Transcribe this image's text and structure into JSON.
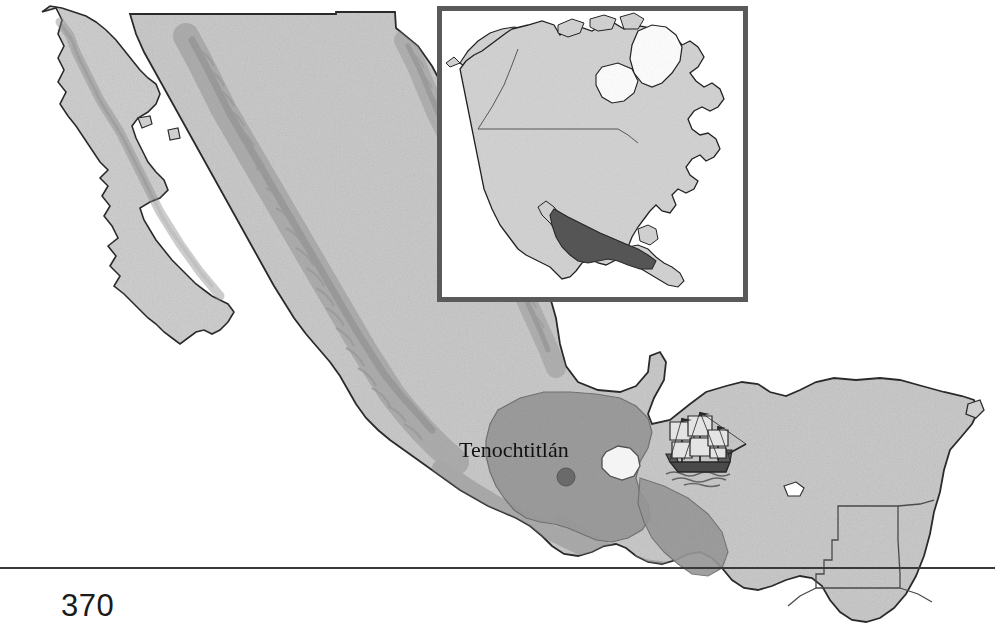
{
  "page": {
    "folio": "370",
    "rule_color": "#3a3a3a",
    "background_color": "#ffffff"
  },
  "map": {
    "title": "Map of Mexico and Central America",
    "subject": "Aztec Empire and the arrival of Spanish ships",
    "projection_note": "relief-shaded outline map",
    "land_fill": "#c9c9c9",
    "land_outline": "#2b2b2b",
    "relief_shadow": "#9b9b9b",
    "empire_fill": "#9a9a9a",
    "water_fill": "#ffffff",
    "border_line": "#4a4a4a"
  },
  "labels": {
    "city": {
      "name": "Tenochtitlán",
      "text": "Tenochtitlán",
      "marker_color": "#6a6a6a",
      "marker_x": 566,
      "marker_y": 477,
      "marker_radius": 9
    }
  },
  "inset": {
    "title": "North America locator inset",
    "frame_color": "#5a5a5a",
    "frame_width_px": 5,
    "land_fill": "#d2d2d2",
    "land_outline": "#222222",
    "highlight_fill": "#555555",
    "highlight_region": "Mexico",
    "internal_border_color": "#4a4a4a",
    "x": 437,
    "y": 6,
    "width": 311,
    "height": 296
  },
  "ship": {
    "name": "spanish-galleon",
    "description": "three-masted sailing ship in the Gulf of Mexico",
    "hull_color": "#3a3a3a",
    "sail_color": "#e8e8e8",
    "x": 700,
    "y": 450
  },
  "regions": [
    {
      "name": "baja-california-peninsula",
      "kind": "land"
    },
    {
      "name": "sea-of-cortez",
      "kind": "water"
    },
    {
      "name": "sierra-madre-occidental",
      "kind": "relief"
    },
    {
      "name": "sierra-madre-oriental",
      "kind": "relief"
    },
    {
      "name": "aztec-empire-core",
      "kind": "empire"
    },
    {
      "name": "lake-texcoco",
      "kind": "water"
    },
    {
      "name": "yucatan-peninsula",
      "kind": "land"
    },
    {
      "name": "gulf-of-mexico",
      "kind": "water"
    },
    {
      "name": "pacific-ocean",
      "kind": "water"
    },
    {
      "name": "guatemala",
      "kind": "land"
    },
    {
      "name": "belize",
      "kind": "land"
    },
    {
      "name": "honduras",
      "kind": "land"
    },
    {
      "name": "cozumel-island",
      "kind": "land"
    }
  ]
}
